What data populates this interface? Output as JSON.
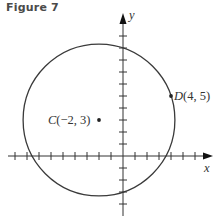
{
  "figure": {
    "title": "Figure 7"
  },
  "axes": {
    "x_label": "x",
    "y_label": "y",
    "origin_px": [
      123,
      156
    ],
    "unit_px": 12,
    "x_ticks": [
      -9,
      -8,
      -7,
      -6,
      -5,
      -4,
      -3,
      -2,
      -1,
      1,
      2,
      3,
      4,
      5,
      6,
      7
    ],
    "y_ticks": [
      -4,
      -3,
      -2,
      -1,
      1,
      2,
      3,
      4,
      5,
      6,
      7,
      8,
      9,
      10,
      11
    ]
  },
  "points": {
    "center": {
      "name": "C",
      "coords": "(−2, 3)",
      "x": -2,
      "y": 3
    },
    "on_circle": {
      "name": "D",
      "coords": "(4, 5)",
      "x": 4,
      "y": 5
    }
  },
  "circle": {
    "center": [
      -2,
      3
    ],
    "radius_squared": 40
  },
  "colors": {
    "stroke": "#3a3a3a",
    "title": "#4a4a4a"
  }
}
